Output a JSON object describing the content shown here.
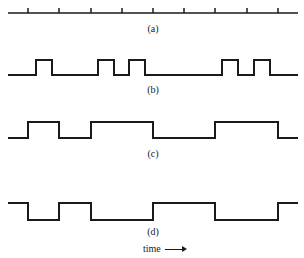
{
  "diagram": {
    "panels": [
      {
        "id": "a",
        "label": "(a)",
        "type": "clock-ticks",
        "ticks_x": [
          28,
          59,
          91,
          122,
          153,
          184,
          215,
          247,
          278
        ]
      },
      {
        "id": "b",
        "label": "(b)",
        "type": "pulse-train",
        "pulses": [
          [
            36,
            52
          ],
          [
            98,
            114
          ],
          [
            129,
            145
          ],
          [
            222,
            238
          ],
          [
            254,
            270
          ]
        ]
      },
      {
        "id": "c",
        "label": "(c)",
        "type": "square-wave",
        "transitions": [
          28,
          59,
          91,
          153,
          215,
          278
        ],
        "initial": "low"
      },
      {
        "id": "d",
        "label": "(d)",
        "type": "square-wave",
        "transitions": [
          28,
          59,
          91,
          153,
          215,
          278
        ],
        "initial": "high"
      }
    ],
    "axis_label": "time",
    "axis_arrow": "right"
  }
}
